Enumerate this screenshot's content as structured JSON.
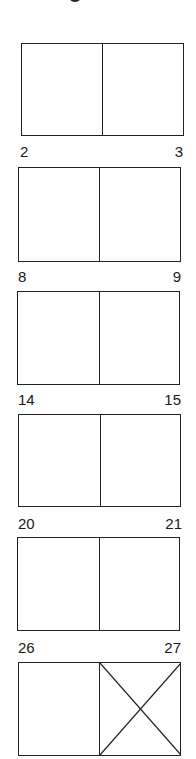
{
  "diagram": {
    "line_color": "#222222",
    "spreads": [
      {
        "left_page": "",
        "right_page": "",
        "box": {
          "x": 21,
          "y": 43,
          "w": 163,
          "h": 93
        },
        "divider_x": 102,
        "crossed_right": false
      },
      {
        "left_page": "2",
        "right_page": "3",
        "box": {
          "x": 18,
          "y": 167,
          "w": 163,
          "h": 95
        },
        "divider_x": 98,
        "crossed_right": false
      },
      {
        "left_page": "8",
        "right_page": "9",
        "box": {
          "x": 17,
          "y": 291,
          "w": 163,
          "h": 94
        },
        "divider_x": 98,
        "crossed_right": false
      },
      {
        "left_page": "14",
        "right_page": "15",
        "box": {
          "x": 18,
          "y": 414,
          "w": 163,
          "h": 93
        },
        "divider_x": 99,
        "crossed_right": false
      },
      {
        "left_page": "20",
        "right_page": "21",
        "box": {
          "x": 17,
          "y": 537,
          "w": 163,
          "h": 94
        },
        "divider_x": 98,
        "crossed_right": false
      },
      {
        "left_page": "26",
        "right_page": "27",
        "box": {
          "x": 18,
          "y": 662,
          "w": 163,
          "h": 94
        },
        "divider_x": 99,
        "crossed_right": true
      }
    ],
    "labels": [
      {
        "text": "2",
        "x": 20,
        "y": 144,
        "align": "left"
      },
      {
        "text": "3",
        "x": 183,
        "y": 144,
        "align": "right"
      },
      {
        "text": "8",
        "x": 18,
        "y": 269,
        "align": "left"
      },
      {
        "text": "9",
        "x": 181,
        "y": 269,
        "align": "right"
      },
      {
        "text": "14",
        "x": 18,
        "y": 392,
        "align": "left"
      },
      {
        "text": "15",
        "x": 181,
        "y": 392,
        "align": "right"
      },
      {
        "text": "20",
        "x": 18,
        "y": 516,
        "align": "left"
      },
      {
        "text": "21",
        "x": 182,
        "y": 516,
        "align": "right"
      },
      {
        "text": "26",
        "x": 18,
        "y": 640,
        "align": "left"
      },
      {
        "text": "27",
        "x": 181,
        "y": 640,
        "align": "right"
      }
    ]
  }
}
